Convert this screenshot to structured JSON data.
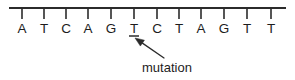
{
  "figure": {
    "type": "dna-sequence-diagram",
    "width": 295,
    "height": 80,
    "background_color": "#ffffff",
    "ink_color": "#1d1d1d",
    "line_color": "#2b2b2b"
  },
  "sequence": {
    "label": "DNA strand",
    "bases": [
      {
        "index": 1,
        "letter": "A",
        "x": 22,
        "mutated": false
      },
      {
        "index": 2,
        "letter": "T",
        "x": 44,
        "mutated": false
      },
      {
        "index": 3,
        "letter": "C",
        "x": 66,
        "mutated": false
      },
      {
        "index": 4,
        "letter": "A",
        "x": 88,
        "mutated": false
      },
      {
        "index": 5,
        "letter": "G",
        "x": 111,
        "mutated": false
      },
      {
        "index": 6,
        "letter": "T",
        "x": 134,
        "mutated": true
      },
      {
        "index": 7,
        "letter": "C",
        "x": 157,
        "mutated": false
      },
      {
        "index": 8,
        "letter": "T",
        "x": 179,
        "mutated": false
      },
      {
        "index": 9,
        "letter": "A",
        "x": 201,
        "mutated": false
      },
      {
        "index": 10,
        "letter": "G",
        "x": 224,
        "mutated": false
      },
      {
        "index": 11,
        "letter": "T",
        "x": 247,
        "mutated": false
      },
      {
        "index": 12,
        "letter": "T",
        "x": 271,
        "mutated": false
      }
    ],
    "sequence_string": "ATCAGTCTAGTT",
    "base_count": 12,
    "mutated_position": 6,
    "mutated_base": "T"
  },
  "backbone": {
    "x_start": 9,
    "x_end": 286,
    "y": 8,
    "tick_length": 11
  },
  "annotation": {
    "text": "mutation",
    "text_x": 142,
    "text_y": 72,
    "arrow_tail_x": 164,
    "arrow_tail_y": 58,
    "arrow_tip_x": 135,
    "arrow_tip_y": 38
  }
}
